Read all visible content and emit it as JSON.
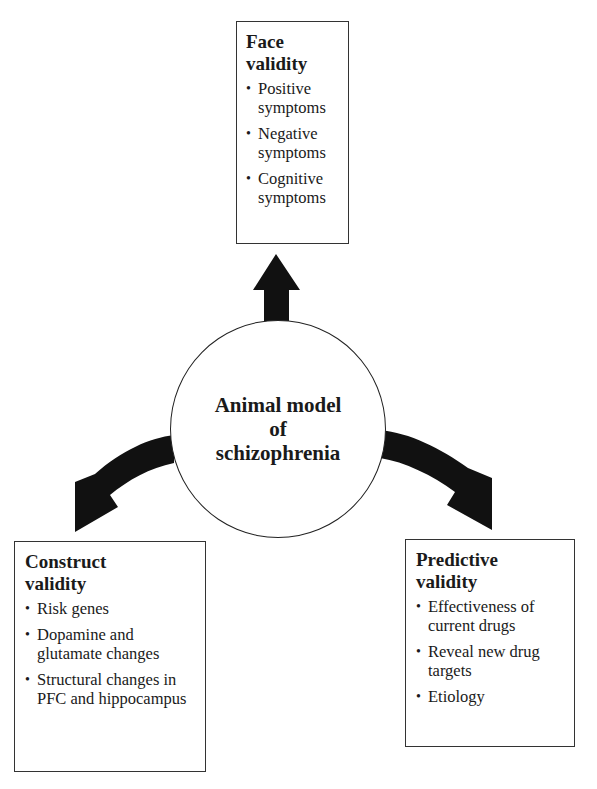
{
  "diagram": {
    "center": {
      "label_line1": "Animal model",
      "label_line2": "of",
      "label_line3": "schizophrenia"
    },
    "boxes": {
      "face": {
        "title_line1": "Face",
        "title_line2": "validity",
        "items": [
          "Positive symptoms",
          "Negative symptoms",
          "Cognitive symptoms"
        ]
      },
      "construct": {
        "title_line1": "Construct",
        "title_line2": "validity",
        "items": [
          "Risk genes",
          "Dopamine and glutamate changes",
          "Structural changes in PFC and hippocampus"
        ]
      },
      "predictive": {
        "title_line1": "Predictive",
        "title_line2": "validity",
        "items": [
          "Effectiveness of current drugs",
          "Reveal new drug targets",
          "Etiology"
        ]
      }
    },
    "arrows": [
      {
        "from": "center",
        "to": "face",
        "direction": "up"
      },
      {
        "from": "center",
        "to": "construct",
        "direction": "down-left"
      },
      {
        "from": "center",
        "to": "predictive",
        "direction": "down-right"
      }
    ],
    "colors": {
      "arrow": "#111111",
      "border": "#333333",
      "text": "#1a1a1a",
      "background": "#ffffff"
    }
  }
}
